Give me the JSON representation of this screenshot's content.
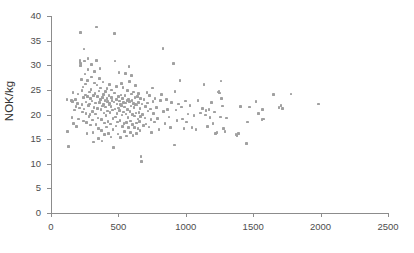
{
  "chart_data": {
    "type": "scatter",
    "title": "",
    "xlabel": "",
    "ylabel": "NOK/kg",
    "xlim": [
      0,
      2500
    ],
    "ylim": [
      0,
      40
    ],
    "xticks": [
      0,
      500,
      1000,
      1500,
      2000,
      2500
    ],
    "yticks": [
      0,
      5,
      10,
      15,
      20,
      25,
      30,
      35,
      40
    ],
    "grid": false,
    "legend": null,
    "marker_color": "#a0a0a0",
    "axis_color": "#8c8c8c",
    "points": [
      [
        118,
        23.1
      ],
      [
        124,
        16.6
      ],
      [
        131,
        13.5
      ],
      [
        150,
        22.8
      ],
      [
        156,
        19.4
      ],
      [
        160,
        22.6
      ],
      [
        163,
        24.5
      ],
      [
        168,
        18.2
      ],
      [
        176,
        20.9
      ],
      [
        181,
        23.0
      ],
      [
        186,
        21.6
      ],
      [
        190,
        17.6
      ],
      [
        196,
        22.2
      ],
      [
        201,
        24.2
      ],
      [
        206,
        19.1
      ],
      [
        210,
        21.3
      ],
      [
        214,
        30.6
      ],
      [
        216,
        31.0
      ],
      [
        218,
        29.9
      ],
      [
        220,
        36.6
      ],
      [
        222,
        30.3
      ],
      [
        226,
        27.1
      ],
      [
        229,
        24.9
      ],
      [
        231,
        22.0
      ],
      [
        234,
        20.5
      ],
      [
        236,
        25.6
      ],
      [
        239,
        23.4
      ],
      [
        241,
        18.7
      ],
      [
        244,
        21.1
      ],
      [
        246,
        33.3
      ],
      [
        248,
        30.9
      ],
      [
        251,
        28.2
      ],
      [
        254,
        26.2
      ],
      [
        256,
        24.0
      ],
      [
        259,
        22.5
      ],
      [
        261,
        20.2
      ],
      [
        264,
        18.4
      ],
      [
        266,
        16.1
      ],
      [
        269,
        23.7
      ],
      [
        271,
        26.9
      ],
      [
        274,
        29.1
      ],
      [
        276,
        31.4
      ],
      [
        279,
        21.8
      ],
      [
        281,
        19.6
      ],
      [
        284,
        24.6
      ],
      [
        286,
        22.1
      ],
      [
        289,
        20.0
      ],
      [
        291,
        17.9
      ],
      [
        294,
        23.3
      ],
      [
        296,
        25.1
      ],
      [
        299,
        27.6
      ],
      [
        301,
        30.2
      ],
      [
        304,
        22.7
      ],
      [
        306,
        20.6
      ],
      [
        309,
        18.9
      ],
      [
        311,
        16.4
      ],
      [
        314,
        14.4
      ],
      [
        316,
        23.9
      ],
      [
        319,
        21.4
      ],
      [
        321,
        26.4
      ],
      [
        324,
        28.7
      ],
      [
        326,
        24.3
      ],
      [
        329,
        22.3
      ],
      [
        331,
        20.1
      ],
      [
        334,
        18.0
      ],
      [
        336,
        37.8
      ],
      [
        339,
        31.0
      ],
      [
        341,
        26.0
      ],
      [
        344,
        23.6
      ],
      [
        346,
        21.2
      ],
      [
        349,
        19.3
      ],
      [
        351,
        17.2
      ],
      [
        354,
        15.1
      ],
      [
        356,
        24.8
      ],
      [
        359,
        22.4
      ],
      [
        361,
        27.3
      ],
      [
        364,
        29.3
      ],
      [
        366,
        25.4
      ],
      [
        369,
        23.1
      ],
      [
        371,
        21.0
      ],
      [
        374,
        19.0
      ],
      [
        376,
        16.8
      ],
      [
        379,
        14.6
      ],
      [
        381,
        23.5
      ],
      [
        384,
        21.7
      ],
      [
        386,
        26.6
      ],
      [
        389,
        24.1
      ],
      [
        391,
        22.0
      ],
      [
        394,
        20.3
      ],
      [
        396,
        18.3
      ],
      [
        399,
        15.9
      ],
      [
        401,
        22.9
      ],
      [
        404,
        24.7
      ],
      [
        406,
        21.5
      ],
      [
        409,
        19.8
      ],
      [
        411,
        17.5
      ],
      [
        414,
        23.2
      ],
      [
        416,
        25.3
      ],
      [
        419,
        22.6
      ],
      [
        421,
        20.7
      ],
      [
        424,
        18.6
      ],
      [
        426,
        16.2
      ],
      [
        429,
        21.9
      ],
      [
        431,
        23.8
      ],
      [
        434,
        26.1
      ],
      [
        436,
        22.2
      ],
      [
        439,
        20.4
      ],
      [
        441,
        18.1
      ],
      [
        444,
        15.4
      ],
      [
        446,
        21.6
      ],
      [
        449,
        23.4
      ],
      [
        451,
        25.0
      ],
      [
        454,
        22.8
      ],
      [
        456,
        20.9
      ],
      [
        459,
        19.2
      ],
      [
        461,
        17.0
      ],
      [
        464,
        13.3
      ],
      [
        466,
        22.5
      ],
      [
        469,
        24.4
      ],
      [
        471,
        36.4
      ],
      [
        474,
        30.9
      ],
      [
        476,
        21.1
      ],
      [
        479,
        19.5
      ],
      [
        481,
        17.7
      ],
      [
        484,
        23.0
      ],
      [
        486,
        25.7
      ],
      [
        489,
        22.1
      ],
      [
        491,
        20.2
      ],
      [
        494,
        18.5
      ],
      [
        496,
        16.0
      ],
      [
        499,
        21.3
      ],
      [
        501,
        23.6
      ],
      [
        504,
        28.5
      ],
      [
        506,
        22.7
      ],
      [
        509,
        20.8
      ],
      [
        511,
        18.8
      ],
      [
        514,
        15.3
      ],
      [
        516,
        22.0
      ],
      [
        519,
        24.0
      ],
      [
        521,
        26.3
      ],
      [
        524,
        21.8
      ],
      [
        526,
        19.9
      ],
      [
        529,
        17.6
      ],
      [
        531,
        23.3
      ],
      [
        534,
        25.5
      ],
      [
        536,
        22.4
      ],
      [
        539,
        20.5
      ],
      [
        541,
        18.2
      ],
      [
        544,
        16.5
      ],
      [
        546,
        21.5
      ],
      [
        549,
        23.9
      ],
      [
        551,
        28.3
      ],
      [
        554,
        22.3
      ],
      [
        556,
        20.1
      ],
      [
        559,
        18.4
      ],
      [
        561,
        15.6
      ],
      [
        564,
        22.8
      ],
      [
        566,
        24.9
      ],
      [
        569,
        21.0
      ],
      [
        571,
        19.4
      ],
      [
        574,
        17.3
      ],
      [
        576,
        23.1
      ],
      [
        579,
        29.8
      ],
      [
        581,
        26.7
      ],
      [
        584,
        22.6
      ],
      [
        586,
        20.6
      ],
      [
        589,
        18.7
      ],
      [
        591,
        16.3
      ],
      [
        594,
        21.7
      ],
      [
        596,
        24.2
      ],
      [
        599,
        27.9
      ],
      [
        601,
        22.9
      ],
      [
        604,
        20.0
      ],
      [
        606,
        18.0
      ],
      [
        609,
        15.7
      ],
      [
        611,
        22.2
      ],
      [
        614,
        24.6
      ],
      [
        616,
        21.4
      ],
      [
        619,
        19.7
      ],
      [
        621,
        17.4
      ],
      [
        624,
        23.5
      ],
      [
        626,
        25.9
      ],
      [
        629,
        22.0
      ],
      [
        631,
        20.3
      ],
      [
        634,
        18.3
      ],
      [
        636,
        16.1
      ],
      [
        639,
        21.9
      ],
      [
        641,
        23.7
      ],
      [
        644,
        19.1
      ],
      [
        646,
        17.1
      ],
      [
        649,
        22.4
      ],
      [
        651,
        24.3
      ],
      [
        654,
        20.4
      ],
      [
        656,
        18.6
      ],
      [
        659,
        16.7
      ],
      [
        661,
        21.2
      ],
      [
        664,
        23.2
      ],
      [
        666,
        19.6
      ],
      [
        669,
        11.5
      ],
      [
        671,
        10.5
      ],
      [
        676,
        22.1
      ],
      [
        681,
        20.0
      ],
      [
        686,
        17.8
      ],
      [
        691,
        23.0
      ],
      [
        696,
        19.3
      ],
      [
        701,
        21.6
      ],
      [
        706,
        18.1
      ],
      [
        711,
        24.5
      ],
      [
        716,
        22.3
      ],
      [
        721,
        20.7
      ],
      [
        726,
        17.5
      ],
      [
        731,
        23.8
      ],
      [
        736,
        21.1
      ],
      [
        741,
        19.0
      ],
      [
        746,
        16.4
      ],
      [
        751,
        25.4
      ],
      [
        756,
        22.6
      ],
      [
        761,
        20.2
      ],
      [
        766,
        18.5
      ],
      [
        771,
        23.3
      ],
      [
        781,
        21.4
      ],
      [
        791,
        19.2
      ],
      [
        801,
        17.0
      ],
      [
        811,
        22.8
      ],
      [
        821,
        24.1
      ],
      [
        831,
        33.4
      ],
      [
        836,
        20.6
      ],
      [
        846,
        18.2
      ],
      [
        856,
        23.0
      ],
      [
        866,
        21.0
      ],
      [
        876,
        19.5
      ],
      [
        886,
        17.3
      ],
      [
        896,
        22.4
      ],
      [
        906,
        30.4
      ],
      [
        911,
        30.3
      ],
      [
        916,
        13.8
      ],
      [
        921,
        24.7
      ],
      [
        926,
        20.9
      ],
      [
        936,
        18.8
      ],
      [
        946,
        22.1
      ],
      [
        956,
        26.9
      ],
      [
        966,
        21.5
      ],
      [
        976,
        19.1
      ],
      [
        986,
        17.2
      ],
      [
        996,
        22.7
      ],
      [
        1006,
        18.5
      ],
      [
        1016,
        20.1
      ],
      [
        1031,
        21.8
      ],
      [
        1046,
        17.4
      ],
      [
        1061,
        19.8
      ],
      [
        1076,
        16.9
      ],
      [
        1091,
        22.9
      ],
      [
        1111,
        20.3
      ],
      [
        1126,
        21.2
      ],
      [
        1136,
        26.1
      ],
      [
        1146,
        19.9
      ],
      [
        1151,
        20.8
      ],
      [
        1161,
        17.6
      ],
      [
        1171,
        21.0
      ],
      [
        1181,
        19.4
      ],
      [
        1191,
        22.4
      ],
      [
        1201,
        18.2
      ],
      [
        1211,
        20.5
      ],
      [
        1221,
        16.1
      ],
      [
        1231,
        16.4
      ],
      [
        1241,
        24.6
      ],
      [
        1246,
        24.8
      ],
      [
        1251,
        24.4
      ],
      [
        1256,
        19.5
      ],
      [
        1261,
        26.8
      ],
      [
        1266,
        23.3
      ],
      [
        1271,
        21.7
      ],
      [
        1281,
        17.1
      ],
      [
        1291,
        16.6
      ],
      [
        1301,
        19.3
      ],
      [
        1371,
        16.0
      ],
      [
        1376,
        15.8
      ],
      [
        1381,
        15.6
      ],
      [
        1391,
        16.2
      ],
      [
        1406,
        21.6
      ],
      [
        1451,
        14.1
      ],
      [
        1456,
        18.5
      ],
      [
        1471,
        21.5
      ],
      [
        1521,
        22.6
      ],
      [
        1541,
        20.2
      ],
      [
        1566,
        19.0
      ],
      [
        1571,
        21.0
      ],
      [
        1576,
        19.1
      ],
      [
        1651,
        24.1
      ],
      [
        1691,
        21.4
      ],
      [
        1706,
        21.8
      ],
      [
        1716,
        21.2
      ],
      [
        1781,
        24.2
      ],
      [
        1986,
        22.1
      ]
    ]
  }
}
